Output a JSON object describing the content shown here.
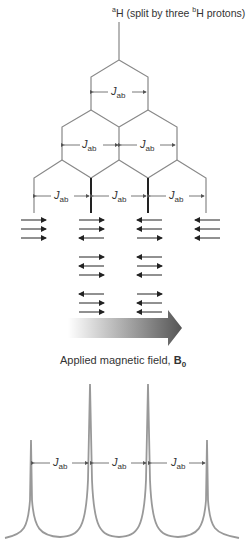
{
  "title": {
    "pre": "a",
    "mid": "H (split by three ",
    "pre2": "b",
    "post": "H protons)"
  },
  "coupling": {
    "symbol": "J",
    "sub": "ab"
  },
  "field_label": {
    "text": "Applied magnetic field, ",
    "symbol": "B",
    "sub": "0"
  },
  "spin_states": [
    [
      [
        "r",
        "r",
        "r"
      ]
    ],
    [
      [
        "r",
        "r",
        "l"
      ],
      [
        "r",
        "l",
        "r"
      ],
      [
        "l",
        "r",
        "r"
      ]
    ],
    [
      [
        "l",
        "l",
        "r"
      ],
      [
        "l",
        "r",
        "l"
      ],
      [
        "r",
        "l",
        "l"
      ]
    ],
    [
      [
        "l",
        "l",
        "l"
      ]
    ]
  ],
  "peaks": {
    "ratio": [
      1,
      3,
      3,
      1
    ]
  },
  "colors": {
    "line": "#888888",
    "arrow": "#222222",
    "text": "#333333",
    "peak": "#999999"
  }
}
